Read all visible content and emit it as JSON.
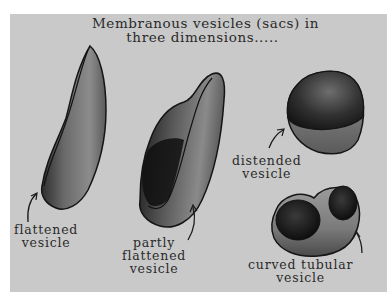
{
  "title": {
    "line1": "Membranous vesicles (sacs) in",
    "line2": "three  dimensions....."
  },
  "labels": {
    "flattened": [
      "flattened",
      "vesicle"
    ],
    "partly_flattened": [
      "partly",
      "flattened",
      "vesicle"
    ],
    "distended": [
      "distended",
      "vesicle"
    ],
    "curved_tubular": [
      "curved tubular",
      "vesicle"
    ]
  },
  "colors": {
    "background": "#c9c9c9",
    "outline": "#1a1a1a",
    "text": "#2a2a2a"
  }
}
